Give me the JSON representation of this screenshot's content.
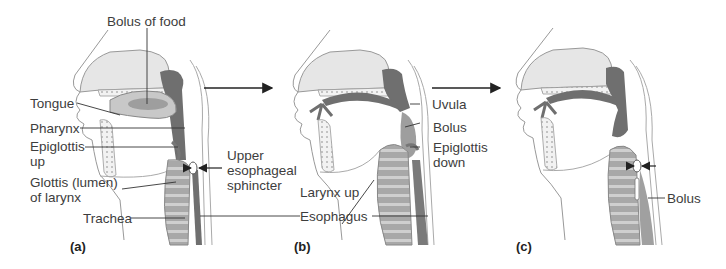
{
  "figure": {
    "panels": [
      {
        "id": "a",
        "letter": "(a)",
        "labels": {
          "bolus_of_food": "Bolus of food",
          "tongue": "Tongue",
          "pharynx": "Pharynx",
          "epiglottis_up": "Epiglottis\nup",
          "glottis": "Glottis (lumen)\nof larynx",
          "trachea": "Trachea",
          "upper_esophageal_sphincter": "Upper\nesophageal\nsphincter"
        }
      },
      {
        "id": "b",
        "letter": "(b)",
        "labels": {
          "uvula": "Uvula",
          "bolus": "Bolus",
          "epiglottis_down": "Epiglottis\ndown",
          "larynx_up": "Larynx up",
          "esophagus": "Esophagus"
        }
      },
      {
        "id": "c",
        "letter": "(c)",
        "labels": {
          "bolus": "Bolus"
        }
      }
    ],
    "sequence_arrows": [
      "a-to-b",
      "b-to-c"
    ],
    "colors": {
      "outline": "#8a8a8a",
      "dark_tissue": "#6f6f6f",
      "mid_tissue": "#9a9a9a",
      "light_fill": "#e6e6e6",
      "label_text": "#3d3d3d",
      "leader_line": "#333333"
    }
  }
}
